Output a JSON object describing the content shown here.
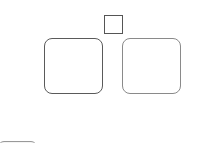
{
  "canvas": {
    "elements": [
      {
        "name": "small-square",
        "type": "checkbox-like square"
      },
      {
        "name": "left-panel",
        "type": "rounded box"
      },
      {
        "name": "right-panel",
        "type": "rounded box"
      },
      {
        "name": "partial-button",
        "type": "partially visible rounded element"
      }
    ]
  },
  "colors": {
    "background": "#ffffff",
    "left_border": "#5a5a5a",
    "right_border": "#8a8a8a",
    "square_border": "#555555"
  }
}
